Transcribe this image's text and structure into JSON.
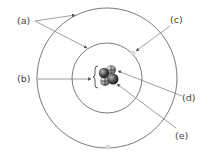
{
  "diagram": {
    "type": "atom-model",
    "labels": {
      "a": "(a)",
      "b": "(b)",
      "c": "(c)",
      "d": "(d)",
      "e": "(e)"
    },
    "colors": {
      "orbit_stroke": "#7a7a7a",
      "arrow_stroke": "#777777",
      "label_text": "#444444",
      "electron_spot": "#dcdcdc",
      "nucleus_dark": "#333333",
      "nucleus_light": "#9a9a9a"
    },
    "annotations": [
      {
        "label": "(a)",
        "points_to": "outer and inner orbit lines"
      },
      {
        "label": "(b)",
        "points_to": "nucleus bracket"
      },
      {
        "label": "(c)",
        "points_to": "electron on inner orbit"
      },
      {
        "label": "(d)",
        "points_to": "proton in nucleus"
      },
      {
        "label": "(e)",
        "points_to": "neutron in nucleus"
      }
    ]
  }
}
